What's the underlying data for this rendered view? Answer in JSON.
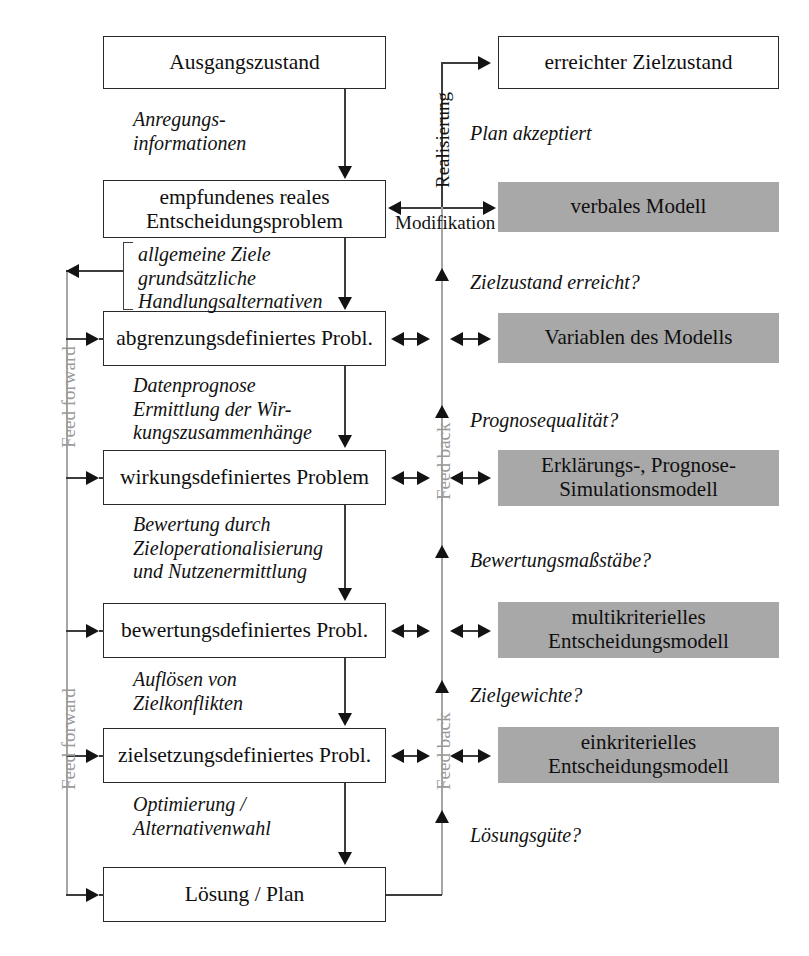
{
  "diagram": {
    "colors": {
      "box_fill": "#ffffff",
      "box_border": "#2a2a2a",
      "model_fill": "#a8a8a8",
      "line": "#3c3c3c",
      "feed_label": "#9a9a9a",
      "text": "#121212"
    }
  },
  "process_boxes": [
    {
      "id": "ausgangszustand",
      "label": "Ausgangszustand"
    },
    {
      "id": "empfundenes-problem",
      "label": "empfundenes reales\nEntscheidungsproblem"
    },
    {
      "id": "abgrenzungsdefiniertes",
      "label": "abgrenzungsdefiniertes Probl."
    },
    {
      "id": "wirkungsdefiniertes",
      "label": "wirkungsdefiniertes Problem"
    },
    {
      "id": "bewertungsdefiniertes",
      "label": "bewertungsdefiniertes Probl."
    },
    {
      "id": "zielsetzungsdefiniertes",
      "label": "zielsetzungsdefiniertes Probl."
    },
    {
      "id": "loesung-plan",
      "label": "Lösung / Plan"
    }
  ],
  "result_box": {
    "id": "erreichter-zielzustand",
    "label": "erreichter Zielzustand"
  },
  "model_boxes": [
    {
      "id": "verbales-modell",
      "label": "verbales Modell"
    },
    {
      "id": "variablen-des-modells",
      "label": "Variablen des Modells"
    },
    {
      "id": "erklaerungs-prognose",
      "label": "Erklärungs-, Prognose-\nSimulationsmodell"
    },
    {
      "id": "multikriterielles",
      "label": "multikriterielles\nEntscheidungsmodell"
    },
    {
      "id": "einkriterielles",
      "label": "einkriterielles\nEntscheidungsmodell"
    }
  ],
  "transition_labels": [
    {
      "id": "anregungsinformationen",
      "text": "Anregungs-\ninformationen"
    },
    {
      "id": "allgemeine-ziele",
      "text": "allgemeine Ziele\ngrundsätzliche\nHandlungsalternativen"
    },
    {
      "id": "datenprognose",
      "text": "Datenprognose\nErmittlung der Wir-\nkungszusammenhänge"
    },
    {
      "id": "bewertung-durch",
      "text": "Bewertung durch\nZieloperationalisierung\nund Nutzenermittlung"
    },
    {
      "id": "aufloesen-von",
      "text": "Auflösen von\nZielkonflikten"
    },
    {
      "id": "optimierung",
      "text": "Optimierung /\nAlternativenwahl"
    }
  ],
  "feedback_labels": [
    {
      "id": "plan-akzeptiert",
      "text": "Plan akzeptiert"
    },
    {
      "id": "zielzustand-erreicht",
      "text": "Zielzustand erreicht?"
    },
    {
      "id": "prognosequalitaet",
      "text": "Prognosequalität?"
    },
    {
      "id": "bewertungsmassstaebe",
      "text": "Bewertungsmaßstäbe?"
    },
    {
      "id": "zielgewichte",
      "text": "Zielgewichte?"
    },
    {
      "id": "loesungsguete",
      "text": "Lösungsgüte?"
    }
  ],
  "edge_labels": {
    "realisierung": "Realisierung",
    "modifikation": "Modifikation"
  },
  "channel_labels": {
    "feed_forward_upper": "Feed forward",
    "feed_forward_lower": "Feed forward",
    "feed_back_upper": "Feed back",
    "feed_back_lower": "Feed back"
  }
}
